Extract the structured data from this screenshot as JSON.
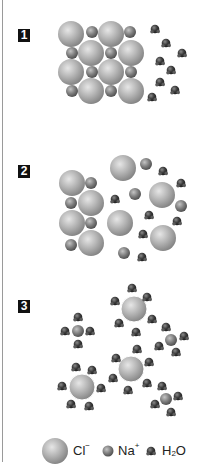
{
  "diagram": {
    "steps": [
      {
        "label": "1",
        "description": "Solid NaCl lattice next to water molecules"
      },
      {
        "label": "2",
        "description": "Ions separating from the lattice"
      },
      {
        "label": "3",
        "description": "Hydrated Na+ and Cl- ions surrounded by water"
      }
    ],
    "legend": {
      "chloride": {
        "symbol": "Cl",
        "charge": "−"
      },
      "sodium": {
        "symbol": "Na",
        "charge": "+"
      },
      "water": {
        "prefix": "H",
        "subscript": "2",
        "suffix": "O"
      }
    },
    "colors": {
      "chloride": "#b8b8b8",
      "sodium": "#7a7a7a",
      "water": "#3a3a3a",
      "label_bg": "#111111"
    }
  }
}
